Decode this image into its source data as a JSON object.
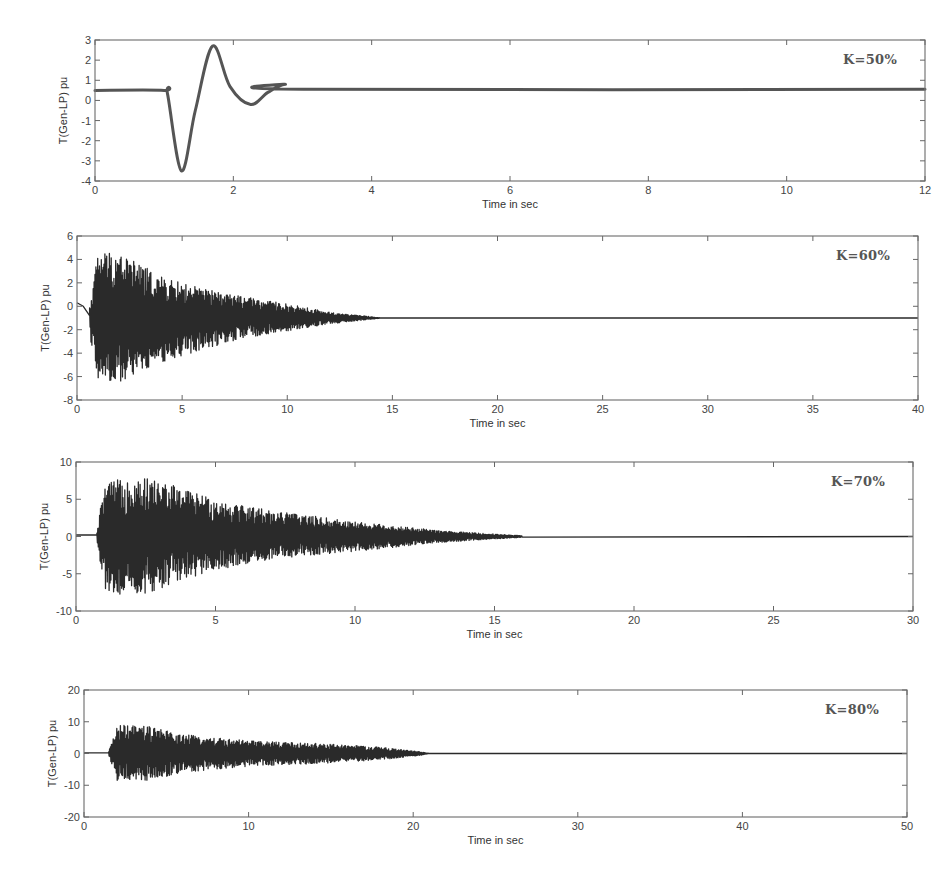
{
  "chart_data": [
    {
      "type": "line",
      "title": "",
      "annotation": "K=50%",
      "xlabel": "Time in sec",
      "ylabel": "T(Gen-LP) pu",
      "xlim": [
        0,
        12
      ],
      "ylim": [
        -4,
        3
      ],
      "xticks": [
        0,
        2,
        4,
        6,
        8,
        10,
        12
      ],
      "yticks": [
        3,
        2,
        1,
        0,
        -1,
        -2,
        -3,
        -4
      ],
      "grid": false,
      "legend": null,
      "series": [
        {
          "name": "T(Gen-LP)",
          "style": "damped-oscillation",
          "x": [
            0,
            1.0,
            1.05,
            1.25,
            1.45,
            1.7,
            1.95,
            2.25,
            2.5,
            2.75,
            3.0,
            12
          ],
          "y": [
            0.5,
            0.5,
            0.3,
            -3.5,
            -0.5,
            2.7,
            0.7,
            -0.2,
            0.4,
            0.8,
            0.55,
            0.55
          ]
        }
      ],
      "frame_px": {
        "left": 95,
        "top": 40,
        "right": 925,
        "bottom": 181
      }
    },
    {
      "type": "line",
      "title": "",
      "annotation": "K=60%",
      "xlabel": "Time in sec",
      "ylabel": "T(Gen-LP) pu",
      "xlim": [
        0,
        40
      ],
      "ylim": [
        -8,
        6
      ],
      "xticks": [
        0,
        5,
        10,
        15,
        20,
        25,
        30,
        35,
        40
      ],
      "yticks": [
        6,
        4,
        2,
        0,
        -2,
        -4,
        -6,
        -8
      ],
      "grid": false,
      "legend": null,
      "series": [
        {
          "name": "T(Gen-LP)",
          "style": "dense-decaying-oscillation",
          "pre_fault_value": 0.3,
          "fault_time": 0.6,
          "settled_value": -1.0,
          "envelope": [
            {
              "t": 0.6,
              "upper": 0.0,
              "lower": -2.5
            },
            {
              "t": 1.0,
              "upper": 4.7,
              "lower": -6.2
            },
            {
              "t": 2.0,
              "upper": 4.7,
              "lower": -6.5
            },
            {
              "t": 4.0,
              "upper": 2.5,
              "lower": -4.8
            },
            {
              "t": 6.0,
              "upper": 1.5,
              "lower": -3.7
            },
            {
              "t": 8.0,
              "upper": 0.8,
              "lower": -2.7
            },
            {
              "t": 10.0,
              "upper": 0.2,
              "lower": -2.1
            },
            {
              "t": 12.0,
              "upper": -0.5,
              "lower": -1.5
            },
            {
              "t": 14.5,
              "upper": -1.0,
              "lower": -1.0
            },
            {
              "t": 40.0,
              "upper": -1.0,
              "lower": -1.0
            }
          ]
        }
      ],
      "frame_px": {
        "left": 77,
        "top": 236,
        "right": 918,
        "bottom": 400
      }
    },
    {
      "type": "line",
      "title": "",
      "annotation": "K=70%",
      "xlabel": "Time in sec",
      "ylabel": "T(Gen-LP) pu",
      "xlim": [
        0,
        30
      ],
      "ylim": [
        -10,
        10
      ],
      "xticks": [
        0,
        5,
        10,
        15,
        20,
        25,
        30
      ],
      "yticks": [
        10,
        5,
        0,
        -5,
        -10
      ],
      "grid": false,
      "legend": null,
      "series": [
        {
          "name": "T(Gen-LP)",
          "style": "dense-decaying-oscillation",
          "pre_fault_value": 0.2,
          "fault_time": 0.75,
          "settled_value": 0.0,
          "envelope": [
            {
              "t": 0.75,
              "upper": 0.5,
              "lower": -0.5
            },
            {
              "t": 1.0,
              "upper": 7.0,
              "lower": -7.0
            },
            {
              "t": 2.0,
              "upper": 8.2,
              "lower": -8.3
            },
            {
              "t": 3.0,
              "upper": 7.5,
              "lower": -7.0
            },
            {
              "t": 5.0,
              "upper": 5.0,
              "lower": -4.5
            },
            {
              "t": 7.0,
              "upper": 3.5,
              "lower": -3.0
            },
            {
              "t": 10.0,
              "upper": 2.0,
              "lower": -2.0
            },
            {
              "t": 13.0,
              "upper": 0.8,
              "lower": -0.8
            },
            {
              "t": 16.0,
              "upper": 0.1,
              "lower": -0.1
            },
            {
              "t": 30.0,
              "upper": 0.0,
              "lower": 0.0
            }
          ]
        }
      ],
      "frame_px": {
        "left": 76,
        "top": 462,
        "right": 913,
        "bottom": 611
      }
    },
    {
      "type": "line",
      "title": "",
      "annotation": "K=80%",
      "xlabel": "Time in sec",
      "ylabel": "T(Gen-LP) pu",
      "xlim": [
        0,
        50
      ],
      "ylim": [
        -20,
        20
      ],
      "xticks": [
        0,
        10,
        20,
        30,
        40,
        50
      ],
      "yticks": [
        20,
        10,
        0,
        -10,
        -20
      ],
      "grid": false,
      "legend": null,
      "series": [
        {
          "name": "T(Gen-LP)",
          "style": "dense-decaying-oscillation",
          "pre_fault_value": 0.2,
          "fault_time": 1.5,
          "settled_value": 0.0,
          "envelope": [
            {
              "t": 1.5,
              "upper": 0.5,
              "lower": -0.5
            },
            {
              "t": 2.0,
              "upper": 9.0,
              "lower": -8.5
            },
            {
              "t": 4.0,
              "upper": 8.5,
              "lower": -8.5
            },
            {
              "t": 6.0,
              "upper": 6.0,
              "lower": -6.0
            },
            {
              "t": 10.0,
              "upper": 4.0,
              "lower": -4.0
            },
            {
              "t": 15.0,
              "upper": 3.0,
              "lower": -3.0
            },
            {
              "t": 18.0,
              "upper": 2.0,
              "lower": -2.0
            },
            {
              "t": 20.5,
              "upper": 0.5,
              "lower": -0.5
            },
            {
              "t": 21.0,
              "upper": 0.0,
              "lower": 0.0
            },
            {
              "t": 50.0,
              "upper": 0.0,
              "lower": 0.0
            }
          ]
        }
      ],
      "frame_px": {
        "left": 84,
        "top": 690,
        "right": 907,
        "bottom": 817
      }
    }
  ]
}
